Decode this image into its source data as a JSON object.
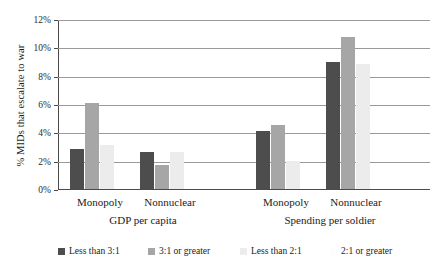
{
  "chart_data": {
    "type": "bar",
    "title": "",
    "xlabel": "",
    "ylabel": "% MIDs that escalate to war",
    "ylim": [
      0,
      12
    ],
    "ytick_labels": [
      "0%",
      "2%",
      "4%",
      "6%",
      "8%",
      "10%",
      "12%"
    ],
    "ytick_values": [
      0,
      2,
      4,
      6,
      8,
      10,
      12
    ],
    "grid": true,
    "legend_position": "bottom",
    "group_labels": [
      "GDP per capita",
      "Spending per soldier"
    ],
    "categories": [
      "Monopoly",
      "Nonnuclear",
      "Monopoly",
      "Nonnuclear"
    ],
    "series": [
      {
        "name": "Less than 3:1",
        "color": "#4d4d4d",
        "values": [
          2.8,
          2.6,
          4.1,
          9.0
        ]
      },
      {
        "name": "3:1 or greater",
        "color": "#a6a6a6",
        "values": [
          6.1,
          1.7,
          4.5,
          10.7
        ]
      },
      {
        "name": "Less than 2:1",
        "color": "#ececec",
        "values": [
          3.1,
          2.6,
          2.0,
          8.8
        ]
      },
      {
        "name": "2:1 or greater",
        "color": "#fdfdfd",
        "values": [
          0,
          0,
          0,
          0
        ]
      }
    ]
  }
}
